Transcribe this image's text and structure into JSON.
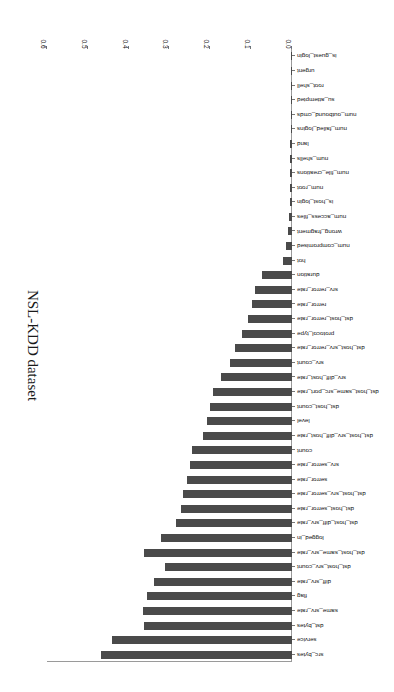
{
  "chart_data": {
    "type": "bar",
    "orientation": "horizontal",
    "title": "NSL-KDD dataset",
    "xlabel": "",
    "ylabel": "NSL-KDD dataset",
    "xlim": [
      0.0,
      0.6
    ],
    "grid": false,
    "legend": null,
    "bar_color": "#4a4a4a",
    "xticks": [
      "0.0",
      "0.1",
      "0.2",
      "0.3",
      "0.4",
      "0.5",
      "0.6"
    ],
    "xtick_values": [
      0.0,
      0.1,
      0.2,
      0.3,
      0.4,
      0.5,
      0.6
    ],
    "categories": [
      "src_bytes",
      "service",
      "dst_bytes",
      "same_srv_rate",
      "flag",
      "diff_srv_rate",
      "dst_host_srv_count",
      "dst_host_same_srv_rate",
      "logged_in",
      "dst_host_diff_srv_rate",
      "dst_host_serror_rate",
      "dst_host_srv_serror_rate",
      "serror_rate",
      "srv_serror_rate",
      "count",
      "dst_host_srv_diff_host_rate",
      "level",
      "dst_host_count",
      "dst_host_same_src_port_rate",
      "srv_diff_host_rate",
      "srv_count",
      "dst_host_srv_rerror_rate",
      "protocol_type",
      "dst_host_rerror_rate",
      "rerror_rate",
      "srv_rerror_rate",
      "duration",
      "hot",
      "num_compromised",
      "wrong_fragment",
      "num_access_files",
      "is_host_login",
      "num_root",
      "num_file_creations",
      "num_shells",
      "land",
      "num_failed_logins",
      "num_outbound_cmds",
      "su_attempted",
      "root_shell",
      "urgent",
      "is_guest_login"
    ],
    "values": [
      0.467,
      0.442,
      0.363,
      0.365,
      0.355,
      0.338,
      0.311,
      0.363,
      0.32,
      0.283,
      0.273,
      0.268,
      0.258,
      0.251,
      0.245,
      0.217,
      0.208,
      0.201,
      0.193,
      0.175,
      0.152,
      0.14,
      0.123,
      0.108,
      0.097,
      0.09,
      0.073,
      0.022,
      0.014,
      0.011,
      0.008,
      0.006,
      0.006,
      0.005,
      0.004,
      0.004,
      0.003,
      0.002,
      0.002,
      0.002,
      0.001,
      0.001
    ]
  }
}
